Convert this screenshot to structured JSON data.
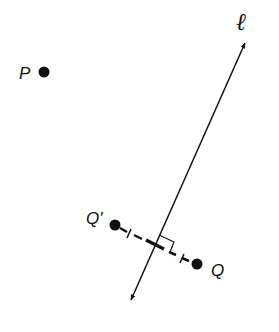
{
  "diagram": {
    "type": "reflection-across-line",
    "labels": {
      "point_p": "P",
      "point_q": "Q",
      "point_q_prime": "Q'",
      "line": "ℓ"
    },
    "colors": {
      "ink": "#111111",
      "background": "#ffffff"
    },
    "elements": [
      {
        "id": "P",
        "kind": "point",
        "label": "P"
      },
      {
        "id": "Q",
        "kind": "point",
        "label": "Q"
      },
      {
        "id": "Q'",
        "kind": "point",
        "label": "Q'"
      },
      {
        "id": "l",
        "kind": "line",
        "label": "ℓ",
        "arrows": "both"
      },
      {
        "id": "QQ'",
        "kind": "dashed-segment",
        "note": "perpendicular to ℓ, congruence tick marks on each half"
      },
      {
        "id": "right-angle",
        "kind": "right-angle-marker"
      }
    ]
  }
}
